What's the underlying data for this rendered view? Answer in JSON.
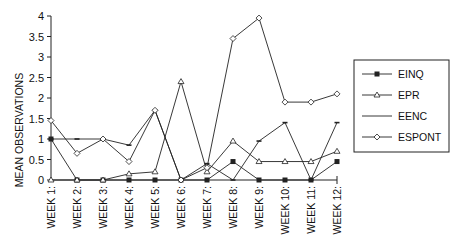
{
  "chart_data": {
    "type": "line",
    "title": "",
    "xlabel": "",
    "ylabel": "MEAN OBSERVATIONS",
    "ylim": [
      0,
      4
    ],
    "yticks": [
      "0",
      "0.5",
      "1",
      "1.5",
      "2",
      "2.5",
      "3",
      "3.5",
      "4"
    ],
    "categories": [
      "WEEK 1:",
      "WEEK 2:",
      "WEEK 3:",
      "WEEK 4:",
      "WEEK 5:",
      "WEEK 6:",
      "WEEK 7:",
      "WEEK 8:",
      "WEEK 9:",
      "WEEK 10:",
      "WEEK 11:",
      "WEEK 12:"
    ],
    "grid": false,
    "legend_position": "right",
    "series": [
      {
        "name": "EINQ",
        "marker": "filled-square",
        "values": [
          1,
          0,
          0,
          0,
          0,
          0,
          0,
          0.45,
          0,
          0,
          0,
          0.45
        ]
      },
      {
        "name": "EPR",
        "marker": "open-triangle",
        "values": [
          0,
          0,
          0,
          0.15,
          0.2,
          2.4,
          0.2,
          0.95,
          0.45,
          0.45,
          0.45,
          0.7
        ]
      },
      {
        "name": "EENC",
        "marker": "dash",
        "values": [
          1,
          1,
          1,
          0.85,
          1.7,
          0,
          0.4,
          0,
          0.95,
          1.4,
          0,
          1.4
        ]
      },
      {
        "name": "ESPONT",
        "marker": "open-diamond",
        "values": [
          1.45,
          0.65,
          1,
          0.45,
          1.7,
          0,
          0.3,
          3.45,
          3.95,
          1.9,
          1.9,
          2.1
        ]
      }
    ]
  },
  "colors": {
    "line": "#222222",
    "background": "#ffffff"
  }
}
